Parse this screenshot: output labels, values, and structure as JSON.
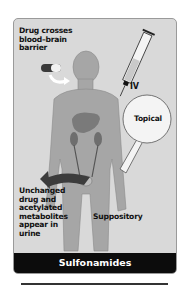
{
  "title": "Sulfonamides",
  "labels": {
    "bbb": [
      "Drug crosses",
      "blood–brain",
      "barrier"
    ],
    "iv": "IV",
    "topical": "Topical",
    "urine": [
      "Unchanged",
      "drug and",
      "acetylated",
      "metabolites",
      "appear in",
      "urine"
    ],
    "suppository": "Suppository"
  },
  "colors": {
    "background": "#d9d9d9",
    "body": "#a8a8a8",
    "title_bar": "#0c0c0c",
    "title_text": "#ffffff"
  }
}
